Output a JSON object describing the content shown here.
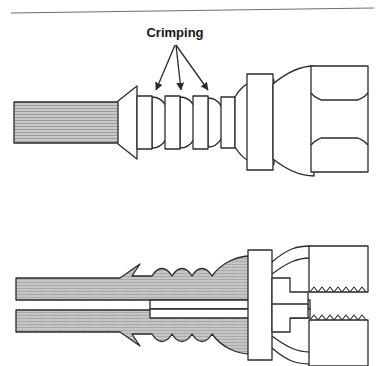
{
  "figure": {
    "type": "technical-line-drawing",
    "background_color": "#ffffff",
    "line_color": "#2b2b2b",
    "metal_fill": "#ffffff",
    "hose_fill": "#c9c9c9",
    "hose_hatch_color": "#8f8f8f",
    "panels": [
      {
        "id": "exterior-view",
        "name": "upper exterior view",
        "description": "external side view of hose with crimped ferrule, fitting body, flange collar and hex nut"
      },
      {
        "id": "section-view",
        "name": "lower cross-section view",
        "description": "sectioned view showing hose wall crimped onto the inner stem, flange and threaded nut"
      }
    ]
  },
  "callout": {
    "label": "Crimping",
    "label_x": 175,
    "label_y": 32,
    "arrow_origin": {
      "x": 175,
      "y": 44
    },
    "arrow_tips": [
      {
        "x": 155,
        "y": 93
      },
      {
        "x": 181,
        "y": 93
      },
      {
        "x": 209,
        "y": 93
      }
    ],
    "arrow_count": 3,
    "arrow_color": "#2b2b2b"
  },
  "top_rule": {
    "name": "page-rule",
    "x1": 11,
    "y1": 13,
    "x2": 374,
    "y2": 8,
    "color": "#6e6e6e"
  },
  "exterior": {
    "hose": {
      "name": "hose",
      "x": 14,
      "y": 102,
      "width": 104,
      "height": 40,
      "fill": "#c9c9c9",
      "hatch": "horizontal-lines"
    },
    "flare": {
      "name": "ferrule-flare",
      "points": "118,96 136,87 136,158 118,148"
    },
    "ferrule_bands": [
      {
        "name": "crimp-band-1",
        "x": 144,
        "y": 97,
        "width": 14,
        "height": 50
      },
      {
        "name": "crimp-band-2",
        "x": 171,
        "y": 97,
        "width": 14,
        "height": 50
      },
      {
        "name": "crimp-band-3",
        "x": 199,
        "y": 97,
        "width": 14,
        "height": 50
      },
      {
        "name": "crimp-band-4",
        "x": 227,
        "y": 98,
        "width": 13,
        "height": 48
      }
    ],
    "ferrule_bulges": [
      {
        "name": "crimp-bulge-1",
        "cx": 164,
        "cy": 122,
        "rx": 14,
        "ry": 30
      },
      {
        "name": "crimp-bulge-2",
        "cx": 192,
        "cy": 122,
        "rx": 14,
        "ry": 30
      },
      {
        "name": "crimp-bulge-3",
        "cx": 220,
        "cy": 122,
        "rx": 14,
        "ry": 30
      }
    ],
    "body": {
      "name": "fitting-body",
      "x": 240,
      "y": 88,
      "width": 46,
      "height": 68
    },
    "collar": {
      "name": "flange-collar",
      "x": 250,
      "y": 76,
      "width": 24,
      "height": 92
    },
    "shoulder": {
      "name": "nut-shoulder",
      "x": 275,
      "y": 84,
      "width": 40,
      "height": 76
    },
    "hex_nut": {
      "name": "hex-nut",
      "x": 312,
      "y": 68,
      "width": 56,
      "height": 100,
      "chamfer_rows": [
        98,
        138
      ],
      "flat_count": 3
    }
  },
  "section": {
    "hose_upper_wall": {
      "name": "hose-wall-upper",
      "x": 16,
      "y": 278,
      "width": 106,
      "height": 22
    },
    "hose_lower_wall": {
      "name": "hose-wall-lower",
      "x": 16,
      "y": 310,
      "width": 106,
      "height": 22
    },
    "bore": {
      "name": "hose-bore",
      "x": 16,
      "y": 300,
      "width": 106,
      "height": 10
    },
    "stem": {
      "name": "inner-stem",
      "x": 150,
      "y": 300,
      "width": 155,
      "height": 12
    },
    "crimp_waves": {
      "name": "crimp-waves",
      "count": 3,
      "start_x": 152,
      "pitch": 28,
      "amplitude": 7
    },
    "flange": {
      "name": "section-flange",
      "x": 248,
      "y": 252,
      "width": 22,
      "height": 108
    },
    "seat": {
      "name": "nut-seat-step",
      "x": 270,
      "y": 276,
      "width": 38,
      "height": 60
    },
    "nut_upper": {
      "name": "nut-body-upper",
      "x": 308,
      "y": 246,
      "width": 60,
      "height": 46
    },
    "nut_lower": {
      "name": "nut-body-lower",
      "x": 308,
      "y": 320,
      "width": 60,
      "height": 46
    },
    "threads": {
      "name": "thread-profile",
      "upper_y": 292,
      "lower_y": 320,
      "x_start": 310,
      "x_end": 366,
      "tooth_count": 14,
      "tooth_height": 5
    }
  }
}
